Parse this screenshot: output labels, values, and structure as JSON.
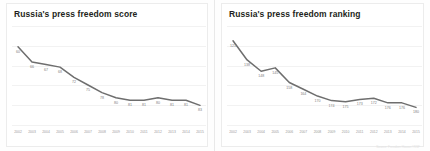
{
  "colors": {
    "line": "#6e6e6e",
    "title_text": "#231f20",
    "label_text": "#7d7d7d",
    "axis_text": "#9a9a9a",
    "grid": "#f2f2f2",
    "panel_border": "#ececec",
    "background": "#ffffff"
  },
  "source_note": "Source: Freedom House / RSF",
  "chart_data": [
    {
      "type": "line",
      "title": "Russia's press freedom score",
      "xlabel": "",
      "ylabel": "",
      "grid": true,
      "legend": "none",
      "categories": [
        "2002",
        "2003",
        "2004",
        "2005",
        "2006",
        "2007",
        "2008",
        "2009",
        "2010",
        "2011",
        "2012",
        "2013",
        "2014",
        "2015"
      ],
      "values": [
        60,
        66,
        67,
        68,
        72,
        75,
        78,
        80,
        81,
        81,
        80,
        81,
        81,
        83
      ],
      "point_labels": [
        "60",
        "66",
        "67",
        "68",
        "72",
        "75",
        "78",
        "80",
        "81",
        "81",
        "80",
        "81",
        "81",
        "83"
      ],
      "ylim": [
        55,
        86
      ],
      "y_inverted": false
    },
    {
      "type": "line",
      "title": "Russia's press freedom ranking",
      "xlabel": "",
      "ylabel": "",
      "grid": true,
      "legend": "none",
      "categories": [
        "2002",
        "2003",
        "2004",
        "2005",
        "2006",
        "2007",
        "2008",
        "2009",
        "2010",
        "2011",
        "2012",
        "2013",
        "2014",
        "2015"
      ],
      "values": [
        121,
        138,
        148,
        145,
        158,
        164,
        170,
        174,
        175,
        173,
        172,
        176,
        176,
        180
      ],
      "point_labels": [
        "121",
        "138",
        "148",
        "145",
        "158",
        "164",
        "170",
        "174",
        "175",
        "173",
        "172",
        "176",
        "176",
        "180"
      ],
      "ylim": [
        115,
        185
      ],
      "y_inverted": false
    }
  ]
}
